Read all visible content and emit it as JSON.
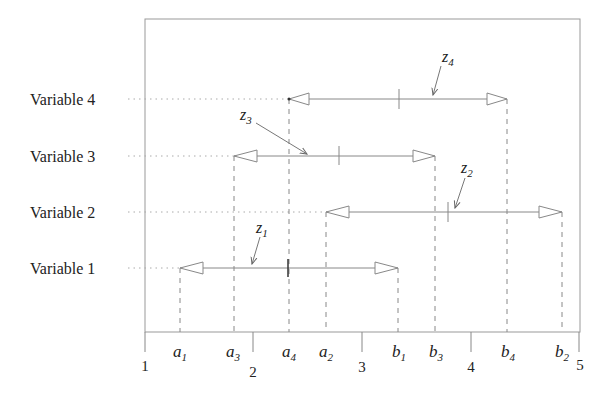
{
  "diagram": {
    "type": "interval-diagram",
    "axis": {
      "ticks": [
        {
          "value": 1,
          "label": "1"
        },
        {
          "value": 2,
          "label": "2"
        },
        {
          "value": 3,
          "label": "3"
        },
        {
          "value": 4,
          "label": "4"
        },
        {
          "value": 5,
          "label": "5"
        }
      ],
      "range": [
        1,
        5
      ]
    },
    "variables": [
      {
        "label": "Variable 4",
        "a": {
          "sym": "a",
          "sub": "4",
          "value": 2.33
        },
        "b": {
          "sym": "b",
          "sub": "4",
          "value": 4.33
        },
        "z": {
          "sym": "z",
          "sub": "4",
          "value": 3.33
        }
      },
      {
        "label": "Variable 3",
        "a": {
          "sym": "a",
          "sub": "3",
          "value": 1.82
        },
        "b": {
          "sym": "b",
          "sub": "3",
          "value": 3.67
        },
        "z": {
          "sym": "z",
          "sub": "3",
          "value": 2.78
        }
      },
      {
        "label": "Variable 2",
        "a": {
          "sym": "a",
          "sub": "2",
          "value": 2.67
        },
        "b": {
          "sym": "b",
          "sub": "2",
          "value": 4.83
        },
        "z": {
          "sym": "z",
          "sub": "2",
          "value": 3.79
        }
      },
      {
        "label": "Variable 1",
        "a": {
          "sym": "a",
          "sub": "1",
          "value": 1.32
        },
        "b": {
          "sym": "b",
          "sub": "1",
          "value": 3.33
        },
        "z": {
          "sym": "z",
          "sub": "1",
          "value": 2.32
        }
      }
    ],
    "colors": {
      "line": "#888888",
      "frame": "#999999",
      "text": "#222222",
      "arrow_fill": "#ffffff"
    }
  }
}
